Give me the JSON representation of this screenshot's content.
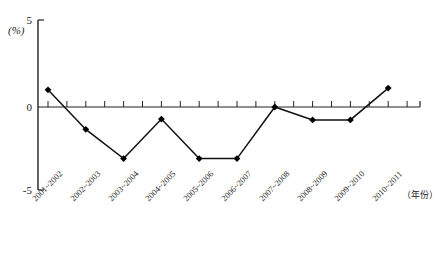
{
  "chart_data": {
    "type": "line",
    "title": "",
    "xlabel": "(年份)",
    "ylabel": "(%)",
    "ylim": [
      -5,
      5
    ],
    "yticks": [
      5,
      0,
      -5
    ],
    "ytick_labels": [
      "5",
      "0",
      "-5"
    ],
    "grid": false,
    "legend": "none",
    "marker": "diamond",
    "categories": [
      "2001~2002",
      "2002~2003",
      "2003~2004",
      "2004~2005",
      "2005~2006",
      "2006~2007",
      "2007~2008",
      "2008~2009",
      "2009~2010",
      "2010~2011"
    ],
    "values": [
      1.0,
      -1.3,
      -3.0,
      -0.7,
      -3.0,
      -3.0,
      0.0,
      -0.75,
      -0.75,
      1.1
    ]
  },
  "axes": {
    "y_unit_label": "(%)",
    "x_unit_label": "（年份）"
  },
  "colors": {
    "line": "#111111",
    "marker": "#000000",
    "axis": "#222222",
    "background": "#ffffff"
  }
}
